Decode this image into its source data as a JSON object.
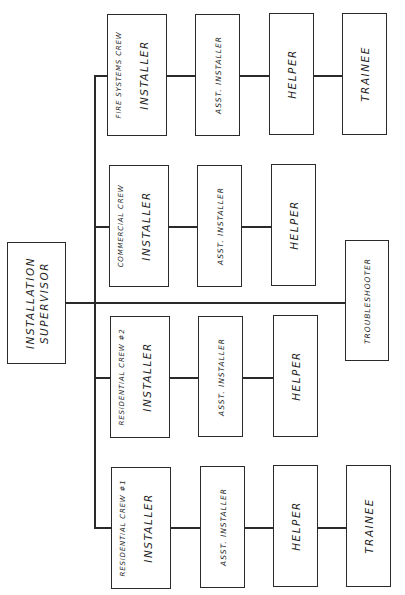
{
  "chart": {
    "orientation": "rotated-90-ccw",
    "root": {
      "label_line1": "INSTALLATION",
      "label_line2": "SUPERVISOR"
    },
    "staff": {
      "label": "TROUBLESHOOTER"
    },
    "crews": [
      {
        "name": "FIRE SYSTEMS CREW",
        "roles": [
          "INSTALLER",
          "ASST. INSTALLER",
          "HELPER",
          "TRAINEE"
        ]
      },
      {
        "name": "COMMERCIAL CREW",
        "roles": [
          "INSTALLER",
          "ASST. INSTALLER",
          "HELPER"
        ]
      },
      {
        "name": "RESIDENTIAL CREW #2",
        "roles": [
          "INSTALLER",
          "ASST. INSTALLER",
          "HELPER"
        ]
      },
      {
        "name": "RESIDENTIAL CREW #1",
        "roles": [
          "INSTALLER",
          "ASST. INSTALLER",
          "HELPER",
          "TRAINEE"
        ]
      }
    ]
  },
  "colors": {
    "line": "#2a2a2a",
    "background": "#ffffff",
    "text": "#1f1f1f"
  }
}
